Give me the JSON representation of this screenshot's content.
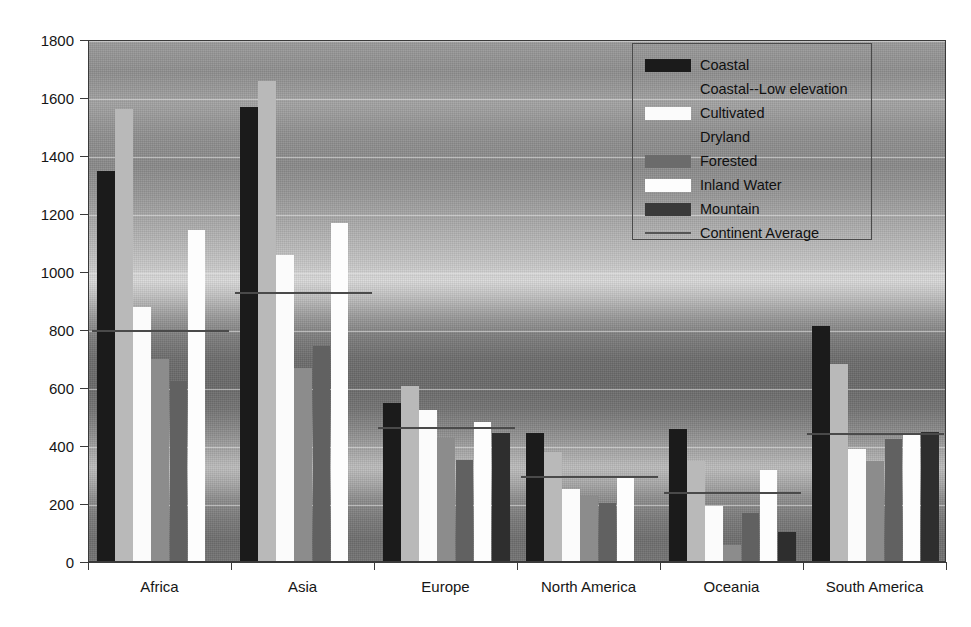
{
  "chart_data": {
    "type": "bar",
    "title": "",
    "xlabel": "",
    "ylabel": "",
    "ylim": [
      0,
      1800
    ],
    "ytick_step": 200,
    "yticks": [
      "0",
      "200",
      "400",
      "600",
      "800",
      "1000",
      "1200",
      "1400",
      "1600",
      "1800"
    ],
    "grid": true,
    "legend_position": "top-right inside plot",
    "categories": [
      "Africa",
      "Asia",
      "Europe",
      "North America",
      "Oceania",
      "South America"
    ],
    "series": [
      {
        "name": "Coastal",
        "color": "#1b1b1b",
        "values": [
          1345,
          1565,
          545,
          440,
          455,
          810
        ]
      },
      {
        "name": "Coastal--Low elevation",
        "color": "#b9b9b9",
        "values": [
          1560,
          1655,
          605,
          375,
          345,
          680
        ]
      },
      {
        "name": "Cultivated",
        "color": "#fbfbfb",
        "values": [
          875,
          1055,
          520,
          250,
          190,
          385
        ]
      },
      {
        "name": "Dryland",
        "color": "#8c8c8c",
        "values": [
          695,
          665,
          425,
          225,
          55,
          345
        ]
      },
      {
        "name": "Forested",
        "color": "#616161",
        "values": [
          620,
          740,
          350,
          200,
          165,
          420
        ]
      },
      {
        "name": "Inland Water",
        "color": "#fdfdfd",
        "values": [
          1140,
          1165,
          480,
          290,
          315,
          435
        ]
      },
      {
        "name": "Mountain",
        "color": "#2e2e2e",
        "values": [
          0,
          0,
          440,
          0,
          100,
          445
        ]
      }
    ],
    "average_series": {
      "name": "Continent Average",
      "color": "#4a4a4a",
      "values": [
        805,
        935,
        470,
        300,
        245,
        450
      ]
    }
  },
  "legend": {
    "items": [
      {
        "label": "Coastal",
        "swatch": "#1b1b1b",
        "kind": "box"
      },
      {
        "label": "Coastal--Low elevation",
        "swatch": "#a8a8a8",
        "kind": "hidden"
      },
      {
        "label": "Cultivated",
        "swatch": "#fbfbfb",
        "kind": "box"
      },
      {
        "label": "Dryland",
        "swatch": "#a8a8a8",
        "kind": "hidden"
      },
      {
        "label": "Forested",
        "swatch": "#6b6b6b",
        "kind": "box"
      },
      {
        "label": "Inland Water",
        "swatch": "#fdfdfd",
        "kind": "box"
      },
      {
        "label": "Mountain",
        "swatch": "#3a3a3a",
        "kind": "box"
      },
      {
        "label": "Continent Average",
        "swatch": "#555555",
        "kind": "line"
      }
    ]
  },
  "colors": {
    "axis": "#3a3a3a",
    "text": "#161616",
    "gridline": "#ebebeb",
    "plot_background_top": "#9c9c9c",
    "plot_background_mid": "#dadada",
    "plot_background_low": "#6a6a6a"
  }
}
